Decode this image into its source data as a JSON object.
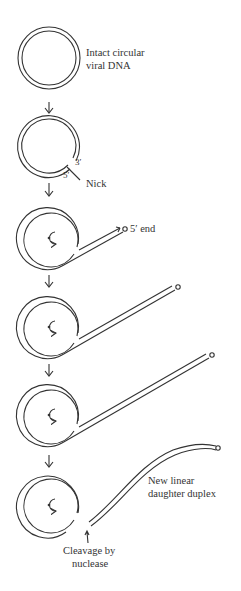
{
  "diagram": {
    "stages": [
      {
        "id": 1,
        "label": "Intact circular viral DNA",
        "lines": [
          "Intact circular",
          "viral DNA"
        ]
      },
      {
        "id": 2,
        "label_nick": "Nick",
        "label_3prime": "3′",
        "label_5prime": "5′"
      },
      {
        "id": 3,
        "label": "5′ end"
      },
      {
        "id": 4
      },
      {
        "id": 5
      },
      {
        "id": 6,
        "label_duplex": [
          "New linear",
          "daughter duplex"
        ],
        "label_cleavage": [
          "Cleavage by",
          "nuclease"
        ]
      }
    ],
    "colors": {
      "stroke": "#333333",
      "background": "#ffffff"
    }
  }
}
